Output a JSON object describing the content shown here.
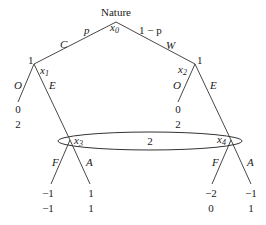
{
  "root": {
    "label": "Nature",
    "node": "x",
    "node_sub": "0"
  },
  "branches_root": [
    {
      "action": "C",
      "prob": "p"
    },
    {
      "action": "W",
      "prob": "1 − p"
    }
  ],
  "left_node": {
    "player": "1",
    "node": "x",
    "node_sub": "1",
    "out_action": "O",
    "enter_action": "E",
    "out_payoff": [
      "0",
      "2"
    ]
  },
  "right_node": {
    "player": "1",
    "node": "x",
    "node_sub": "2",
    "out_action": "O",
    "enter_action": "E",
    "out_payoff": [
      "0",
      "2"
    ]
  },
  "info_set": {
    "player": "2"
  },
  "x3": {
    "node": "x",
    "node_sub": "3",
    "fight": "F",
    "accommodate": "A",
    "fight_payoff": [
      "−1",
      "−1"
    ],
    "acc_payoff": [
      "1",
      "1"
    ]
  },
  "x4": {
    "node": "x",
    "node_sub": "4",
    "fight": "F",
    "accommodate": "A",
    "fight_payoff": [
      "−2",
      "0"
    ],
    "acc_payoff": [
      "−1",
      "1"
    ]
  }
}
